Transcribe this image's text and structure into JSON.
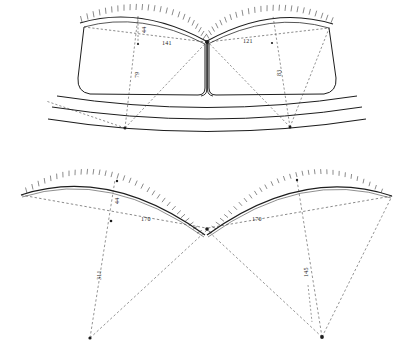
{
  "drawing": {
    "title": "Two-bay vault geometry construction drawing",
    "background_color": "#ffffff",
    "ink_color": "#1d1d1d",
    "figures": [
      {
        "id": "upper-figure",
        "name": "upper-vault-elevation",
        "description": "Two adjoining hatched arches meeting at a central cusp, with a rounded vault body and three horizontal banding curves below",
        "labels": [
          {
            "name": "rise-left",
            "text": "44",
            "orientation": "vertical"
          },
          {
            "name": "radius-left-horizontal",
            "text": "141",
            "orientation": "horizontal"
          },
          {
            "name": "radius-right-horizontal",
            "text": "121",
            "orientation": "horizontal"
          },
          {
            "name": "drop-left",
            "text": "79",
            "orientation": "vertical"
          },
          {
            "name": "drop-right",
            "text": "83",
            "orientation": "vertical"
          }
        ]
      },
      {
        "id": "lower-figure",
        "name": "lower-arc-construction",
        "description": "Two hatched arcs meeting at a central cusp with dashed radius lines converging to two centre points below",
        "labels": [
          {
            "name": "rise-left",
            "text": "44",
            "orientation": "vertical"
          },
          {
            "name": "radius-left-horizontal",
            "text": "170",
            "orientation": "horizontal"
          },
          {
            "name": "radius-right-horizontal",
            "text": "170",
            "orientation": "horizontal"
          },
          {
            "name": "drop-left",
            "text": "311",
            "orientation": "vertical"
          },
          {
            "name": "drop-right",
            "text": "145",
            "orientation": "vertical"
          }
        ]
      }
    ]
  }
}
